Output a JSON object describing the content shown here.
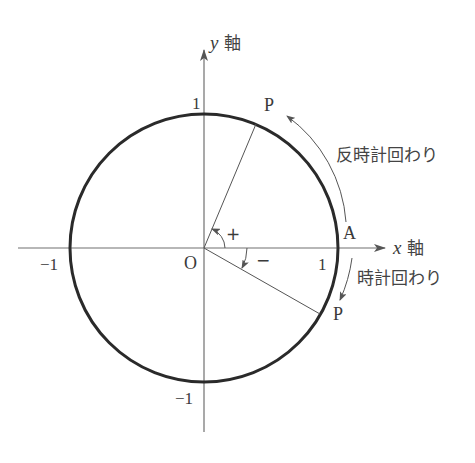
{
  "diagram": {
    "colors": {
      "circle": "#2a2a2a",
      "axis": "#707070",
      "line": "#555555",
      "text": "#3a3a3a",
      "background": "#ffffff"
    },
    "axes": {
      "x_label_var": "x",
      "x_label_jp": "軸",
      "y_label_var": "y",
      "y_label_jp": "軸"
    },
    "ticks": {
      "x_pos": "1",
      "x_neg": "−1",
      "y_pos": "1",
      "y_neg": "−1"
    },
    "origin_label": "O",
    "point_A_label": "A",
    "point_P_upper_label": "P",
    "point_P_lower_label": "P",
    "angles": {
      "positive_sign": "+",
      "negative_sign": "−"
    },
    "rotation_labels": {
      "counterclockwise": "反時計回わり",
      "clockwise": "時計回わり"
    }
  }
}
